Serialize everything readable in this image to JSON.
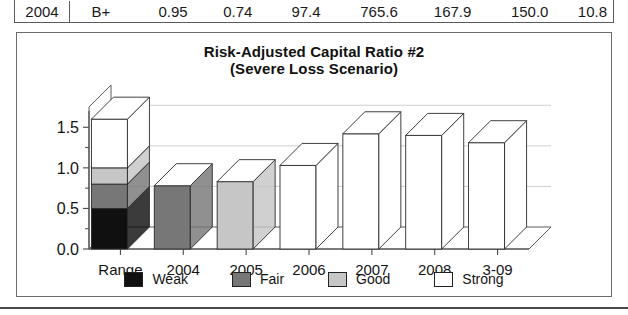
{
  "table": {
    "row": [
      "2004",
      "B+",
      "0.95",
      "0.74",
      "97.4",
      "765.6",
      "167.9",
      "150.0",
      "10.8"
    ]
  },
  "chart": {
    "title_line1": "Risk-Adjusted Capital Ratio #2",
    "title_line2": "(Severe Loss Scenario)"
  },
  "legend": {
    "items": [
      {
        "label": "Weak",
        "color": "#101010"
      },
      {
        "label": "Fair",
        "color": "#777777"
      },
      {
        "label": "Good",
        "color": "#c6c6c6"
      },
      {
        "label": "Strong",
        "color": "#ffffff"
      }
    ]
  },
  "chart_data": {
    "type": "bar",
    "subtype": "3d-column-with-stacked-range",
    "title": "Risk-Adjusted Capital Ratio #2 (Severe Loss Scenario)",
    "xlabel": "",
    "ylabel": "",
    "ylim": [
      0.0,
      1.75
    ],
    "yticks": [
      0.0,
      0.5,
      1.0,
      1.5
    ],
    "ytick_labels": [
      "0.0",
      "0.5",
      "1.0",
      "1.5"
    ],
    "yminor_ticks": [
      0.25,
      0.75,
      1.25
    ],
    "grid": true,
    "grid_axis": "y",
    "legend_position": "bottom",
    "categories": [
      "Range",
      "2004",
      "2005",
      "2006",
      "2007",
      "2008",
      "3-09"
    ],
    "range_stack": {
      "category": "Range",
      "segments": [
        {
          "name": "Weak",
          "from": 0.0,
          "to": 0.5,
          "height": 0.5,
          "color": "#101010"
        },
        {
          "name": "Fair",
          "from": 0.5,
          "to": 0.8,
          "height": 0.3,
          "color": "#777777"
        },
        {
          "name": "Good",
          "from": 0.8,
          "to": 1.0,
          "height": 0.2,
          "color": "#c6c6c6"
        },
        {
          "name": "Strong",
          "from": 1.0,
          "to": 1.6,
          "height": 0.6,
          "color": "#ffffff"
        }
      ],
      "total": 1.6
    },
    "series": [
      {
        "name": "Risk-Adjusted Capital Ratio #2",
        "points": [
          {
            "category": "2004",
            "value": 0.78,
            "rating": "Fair",
            "color": "#777777"
          },
          {
            "category": "2005",
            "value": 0.83,
            "rating": "Good",
            "color": "#c6c6c6"
          },
          {
            "category": "2006",
            "value": 1.03,
            "rating": "Strong",
            "color": "#ffffff"
          },
          {
            "category": "2007",
            "value": 1.42,
            "rating": "Strong",
            "color": "#ffffff"
          },
          {
            "category": "2008",
            "value": 1.4,
            "rating": "Strong",
            "color": "#ffffff"
          },
          {
            "category": "3-09",
            "value": 1.31,
            "rating": "Strong",
            "color": "#ffffff"
          }
        ]
      }
    ]
  }
}
